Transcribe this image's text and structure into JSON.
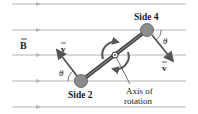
{
  "diagram": {
    "field_label": "B",
    "field_label_has_vector_arrow": true,
    "side_top_label": "Side 4",
    "side_bottom_label": "Side 2",
    "velocity_label": "v",
    "angle_label": "θ",
    "axis_label_line1": "Axis of",
    "axis_label_line2": "rotation",
    "field_lines_y": [
      4,
      30,
      55,
      81,
      107
    ],
    "colors": {
      "field_line": "#b3b3b3",
      "rod": "#3a3a3a",
      "ball": "#8c8c8c",
      "arrow": "#555555",
      "text": "#1a1a1a"
    }
  }
}
